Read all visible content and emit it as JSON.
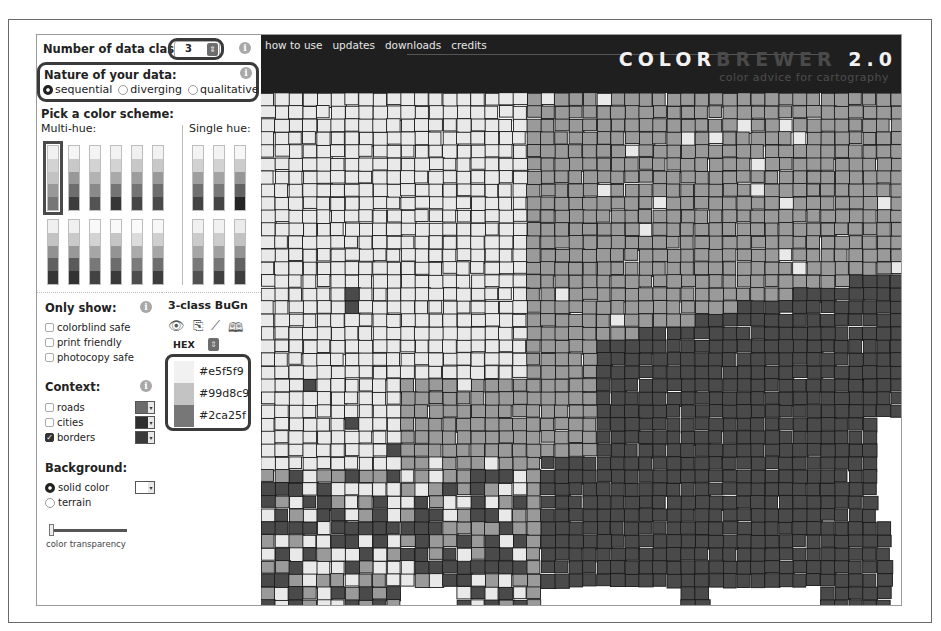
{
  "controls": {
    "classes_label": "Number of data classes",
    "classes_value": "3",
    "nature_title": "Nature of your data:",
    "nature_options": [
      {
        "label": "sequential",
        "selected": true
      },
      {
        "label": "diverging",
        "selected": false
      },
      {
        "label": "qualitative",
        "selected": false
      }
    ],
    "pick_title": "Pick a color scheme:",
    "multi_hue_label": "Multi-hue:",
    "single_hue_label": "Single hue:",
    "info_glyph": "i"
  },
  "schemes": {
    "multi_row1": [
      [
        "#e5f5f9",
        "#b8e0da",
        "#99d8c9",
        "#5fb796",
        "#2ca25f"
      ],
      [
        "#edf8fb",
        "#b3cde3",
        "#8c96c6",
        "#8856a7",
        "#810f7c"
      ],
      [
        "#f0f9e8",
        "#bae4bc",
        "#7bccc4",
        "#43a2ca",
        "#0868ac"
      ],
      [
        "#fef0d9",
        "#fdcc8a",
        "#fc8d59",
        "#e34a33",
        "#b30000"
      ],
      [
        "#f1eef6",
        "#bdc9e1",
        "#74a9cf",
        "#2b8cbe",
        "#045a8d"
      ],
      [
        "#f6eff7",
        "#bdc9e1",
        "#67a9cf",
        "#1c9099",
        "#016c59"
      ]
    ],
    "multi_row2": [
      [
        "#f1eef6",
        "#d7b5d8",
        "#df65b0",
        "#dd1c77",
        "#980043"
      ],
      [
        "#feebe2",
        "#fbb4b9",
        "#f768a1",
        "#c51b8a",
        "#7a0177"
      ],
      [
        "#ffffcc",
        "#c2e699",
        "#78c679",
        "#31a354",
        "#006837"
      ],
      [
        "#ffffcc",
        "#a1dab4",
        "#41b6c4",
        "#2c7fb8",
        "#253494"
      ],
      [
        "#ffffd4",
        "#fed98e",
        "#fe9929",
        "#d95f0e",
        "#993404"
      ],
      [
        "#ffffb2",
        "#fecc5c",
        "#fd8d3c",
        "#f03b20",
        "#bd0026"
      ]
    ],
    "single_row1": [
      [
        "#eff3ff",
        "#bdd7e7",
        "#6baed6",
        "#3182bd",
        "#08519c"
      ],
      [
        "#edf8e9",
        "#bae4b3",
        "#74c476",
        "#31a354",
        "#006d2c"
      ],
      [
        "#f7f7f7",
        "#cccccc",
        "#969696",
        "#636363",
        "#252525"
      ]
    ],
    "single_row2": [
      [
        "#feedde",
        "#fdbe85",
        "#fd8d3c",
        "#e6550d",
        "#a63603"
      ],
      [
        "#f2f0f7",
        "#cbc9e2",
        "#9e9ac8",
        "#756bb1",
        "#54278f"
      ],
      [
        "#fee5d9",
        "#fcae91",
        "#fb6a4a",
        "#de2d26",
        "#a50f15"
      ]
    ],
    "selected_index": 0
  },
  "only_show": {
    "title": "Only show:",
    "options": [
      {
        "label": "colorblind safe",
        "checked": false
      },
      {
        "label": "print friendly",
        "checked": false
      },
      {
        "label": "photocopy safe",
        "checked": false
      }
    ]
  },
  "context": {
    "title": "Context:",
    "options": [
      {
        "label": "roads",
        "checked": false,
        "color": "#6b6b6b"
      },
      {
        "label": "cities",
        "checked": false,
        "color": "#2e2e2e"
      },
      {
        "label": "borders",
        "checked": true,
        "color": "#3a3a3a"
      }
    ]
  },
  "background": {
    "title": "Background:",
    "options": [
      {
        "label": "solid color",
        "selected": true
      },
      {
        "label": "terrain",
        "selected": false
      }
    ],
    "swatch_color": "#ffffff",
    "slider_label": "color transparency",
    "slider_value": 0
  },
  "legend": {
    "title": "3-class BuGn",
    "icons": [
      "eye-icon",
      "clipboard-icon",
      "ruler-icon",
      "book-icon"
    ],
    "format": "HEX",
    "export_label": "EXPORT",
    "colors": [
      {
        "hex": "#e5f5f9"
      },
      {
        "hex": "#99d8c9"
      },
      {
        "hex": "#2ca25f"
      }
    ]
  },
  "header": {
    "nav": [
      "how to use",
      "updates",
      "downloads",
      "credits"
    ],
    "brand_part1": "COLOR",
    "brand_part2": "BREWER",
    "brand_part3": " 2.0",
    "tagline": "color advice for cartography"
  },
  "map": {
    "class_colors": [
      "#e9e9e9",
      "#9a9a9a",
      "#4a4a4a"
    ],
    "border_color": "#1a1a1a",
    "background": "#ffffff"
  }
}
